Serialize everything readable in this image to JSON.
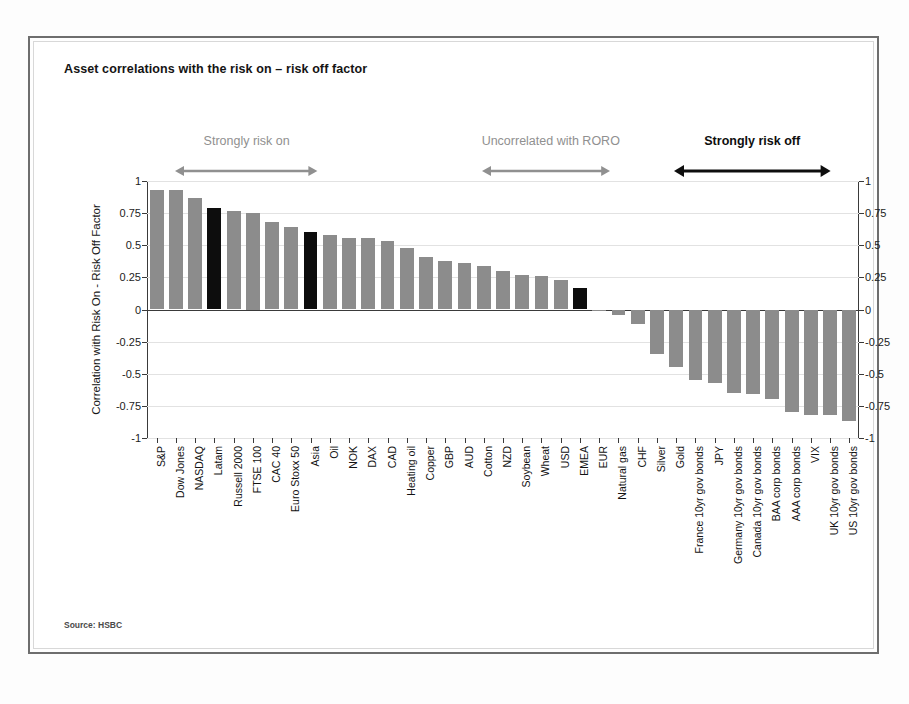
{
  "figure": {
    "title": "Asset correlations with the risk on – risk off factor",
    "source": "Source: HSBC"
  },
  "annotations": [
    {
      "label": "Strongly risk on",
      "style": "grey",
      "x_pct": 4,
      "width_pct": 20
    },
    {
      "label": "Uncorrelated with RORO",
      "style": "grey",
      "x_pct": 47,
      "width_pct": 18
    },
    {
      "label": "Strongly risk off",
      "style": "dark",
      "x_pct": 74,
      "width_pct": 22
    }
  ],
  "colors": {
    "bar": "#8c8c8c",
    "bar_highlight": "#0d0d0d",
    "axis": "#3a3a3a",
    "grid": "#e2e2e2",
    "annotation_grey": "#909090",
    "annotation_dark": "#0e0e0e"
  },
  "chart_data": {
    "type": "bar",
    "title": "Asset correlations with the risk on – risk off factor",
    "xlabel": "",
    "ylabel": "Correlation with Risk On - Risk Off Factor",
    "ylim": [
      -1,
      1
    ],
    "yticks": [
      1,
      0.75,
      0.5,
      0.25,
      0,
      -0.25,
      -0.5,
      -0.75,
      -1
    ],
    "ytick_labels": [
      "1",
      "0.75",
      "0.5",
      "0.25",
      "0",
      "-0.25",
      "-0.5",
      "-0.75",
      "-1"
    ],
    "ytick_labels_right": [
      "1",
      "0.75",
      "0.5",
      "0.25",
      "0",
      "-0.25",
      "-0.5",
      "-0.75",
      "-1"
    ],
    "grid": true,
    "legend": "none",
    "axis_right_mirrored": true,
    "highlight_color": "#0d0d0d",
    "categories": [
      "S&P",
      "Dow Jones",
      "NASDAQ",
      "Latam",
      "Russell 2000",
      "FTSE 100",
      "CAC 40",
      "Euro Stoxx 50",
      "Asia",
      "Oil",
      "NOK",
      "DAX",
      "CAD",
      "Heating oil",
      "Copper",
      "GBP",
      "AUD",
      "Cotton",
      "NZD",
      "Soybean",
      "Wheat",
      "USD",
      "EMEA",
      "EUR",
      "Natural gas",
      "CHF",
      "Silver",
      "Gold",
      "France 10yr gov bonds",
      "JPY",
      "Germany 10yr gov bonds",
      "Canada 10yr gov bonds",
      "BAA corp bonds",
      "AAA corp bonds",
      "VIX",
      "UK 10yr gov bonds",
      "US 10yr gov bonds"
    ],
    "values": [
      0.93,
      0.93,
      0.87,
      0.79,
      0.77,
      0.75,
      0.68,
      0.64,
      0.6,
      0.58,
      0.56,
      0.56,
      0.53,
      0.48,
      0.41,
      0.38,
      0.36,
      0.34,
      0.3,
      0.27,
      0.26,
      0.23,
      0.17,
      -0.01,
      -0.04,
      -0.11,
      -0.35,
      -0.45,
      -0.55,
      -0.57,
      -0.65,
      -0.66,
      -0.7,
      -0.8,
      -0.82,
      -0.82,
      -0.87
    ],
    "highlighted": [
      "Latam",
      "Asia",
      "EMEA"
    ]
  }
}
